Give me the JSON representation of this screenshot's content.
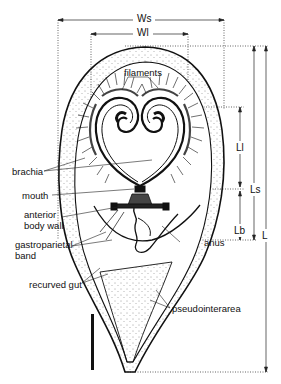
{
  "diagram": {
    "labels": {
      "filaments": "filaments",
      "brachia": "brachia",
      "mouth": "mouth",
      "anterior_body_wall_1": "anterior",
      "anterior_body_wall_2": "body wall",
      "gastroparietal_band_1": "gastroparietal",
      "gastroparietal_band_2": "band",
      "recurved_gut": "recurved gut",
      "anus": "anus",
      "pseudointerarea": "pseudointerarea"
    },
    "dimensions": {
      "shell_width": "Ws",
      "lophophore_width": "Wl",
      "lophophore_length": "Ll",
      "shell_length": "Ls",
      "body_length": "Lb",
      "total_length": "L"
    },
    "scale_bar": {
      "label": ""
    },
    "colors": {
      "ink": "#111111",
      "background": "#ffffff"
    }
  }
}
